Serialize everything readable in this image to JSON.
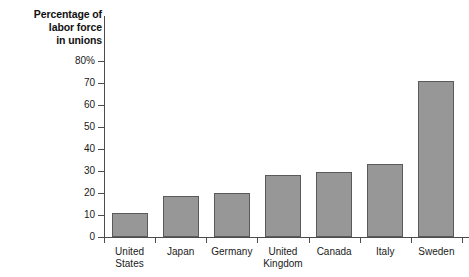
{
  "chart_data": {
    "type": "bar",
    "title": "Percentage of labor force in unions",
    "title_lines": [
      "Percentage of",
      "labor force",
      "in unions"
    ],
    "xlabel": "",
    "ylabel": "Percentage of labor force in unions",
    "ylim": [
      0,
      80
    ],
    "ytick_step": 10,
    "grid": false,
    "legend": null,
    "bar_color": "#979797",
    "bar_border_color": "#5a5a5a",
    "axis_color": "#4c4c4c",
    "categories": [
      "United States",
      "Japan",
      "Germany",
      "United Kingdom",
      "Canada",
      "Italy",
      "Sweden"
    ],
    "category_lines": [
      [
        "United",
        "States"
      ],
      [
        "Japan"
      ],
      [
        "Germany"
      ],
      [
        "United",
        "Kingdom"
      ],
      [
        "Canada"
      ],
      [
        "Italy"
      ],
      [
        "Sweden"
      ]
    ],
    "values": [
      11,
      18.5,
      20,
      28,
      29.5,
      33,
      71
    ],
    "ytick_labels": [
      "0",
      "10",
      "20",
      "30",
      "40",
      "50",
      "60",
      "70",
      "80%"
    ],
    "ytick_values": [
      0,
      10,
      20,
      30,
      40,
      50,
      60,
      70,
      80
    ]
  }
}
